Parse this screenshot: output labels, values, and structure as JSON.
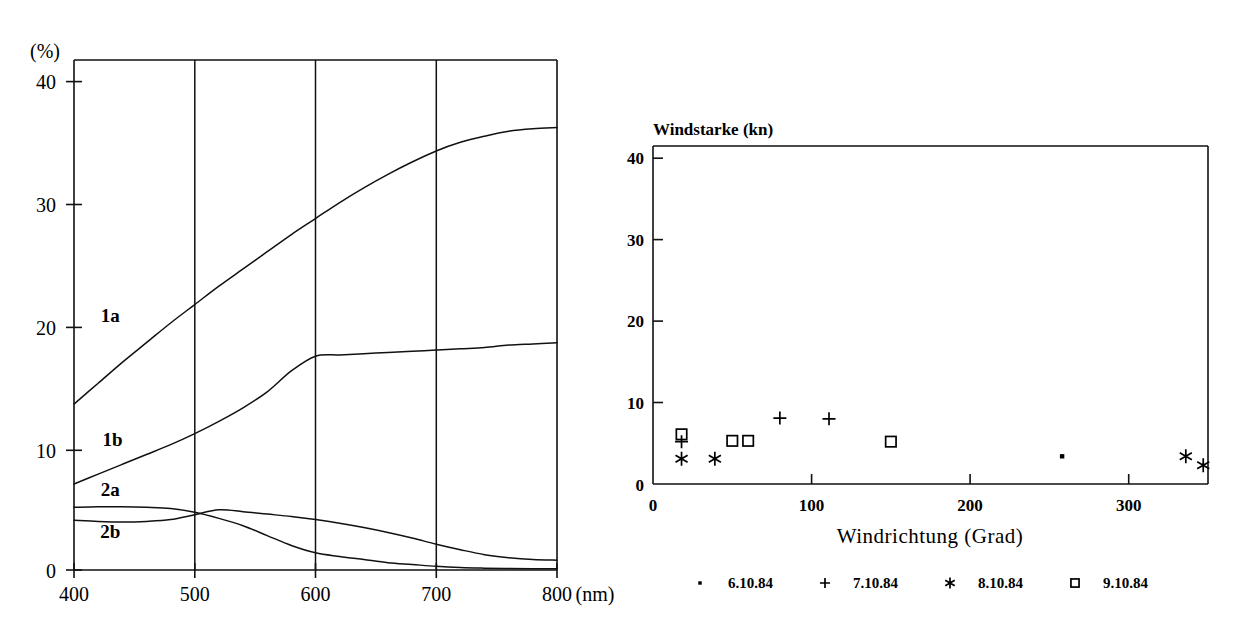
{
  "chart_data": [
    {
      "id": "spectral-transmission-chart",
      "type": "line",
      "title": "",
      "xlabel": "(nm)",
      "ylabel": "(%)",
      "xlim": [
        400,
        800
      ],
      "ylim": [
        0,
        41.5
      ],
      "xticks": [
        400,
        500,
        600,
        700,
        800
      ],
      "yticks": [
        0,
        10,
        20,
        30,
        40
      ],
      "xtick_labels": [
        "400",
        "500",
        "600",
        "700",
        "800"
      ],
      "ytick_labels": [
        "0",
        "10",
        "20",
        "30",
        "40"
      ],
      "grid": "vertical",
      "legend_position": "inline-curve-labels",
      "x": [
        400,
        420,
        440,
        460,
        480,
        500,
        520,
        540,
        560,
        580,
        600,
        620,
        640,
        660,
        680,
        700,
        720,
        740,
        760,
        780,
        800
      ],
      "series": [
        {
          "name": "1a",
          "label": "1a",
          "label_x": 430,
          "label_y": 20.2,
          "values": [
            13.5,
            15.2,
            16.9,
            18.5,
            20.1,
            21.6,
            23.1,
            24.5,
            25.9,
            27.3,
            28.6,
            29.9,
            31.1,
            32.2,
            33.2,
            34.1,
            34.8,
            35.3,
            35.7,
            35.9,
            36.0
          ]
        },
        {
          "name": "1b",
          "label": "1b",
          "label_x": 432,
          "label_y": 10.1,
          "values": [
            7.0,
            7.8,
            8.6,
            9.4,
            10.2,
            11.1,
            12.1,
            13.2,
            14.5,
            16.2,
            17.4,
            17.5,
            17.6,
            17.7,
            17.8,
            17.9,
            18.0,
            18.1,
            18.3,
            18.4,
            18.5
          ]
        },
        {
          "name": "2a",
          "label": "2a",
          "label_x": 430,
          "label_y": 6.0,
          "values": [
            5.1,
            5.15,
            5.15,
            5.1,
            5.0,
            4.7,
            4.2,
            3.6,
            2.8,
            2.0,
            1.4,
            1.1,
            0.85,
            0.6,
            0.45,
            0.3,
            0.2,
            0.15,
            0.12,
            0.1,
            0.1
          ]
        },
        {
          "name": "2b",
          "label": "2b",
          "label_x": 430,
          "label_y": 2.6,
          "values": [
            4.05,
            3.95,
            3.9,
            3.95,
            4.1,
            4.5,
            4.9,
            4.75,
            4.55,
            4.35,
            4.1,
            3.8,
            3.45,
            3.05,
            2.6,
            2.1,
            1.65,
            1.25,
            1.0,
            0.85,
            0.8
          ]
        }
      ]
    },
    {
      "id": "wind-scatter-chart",
      "type": "scatter",
      "title": "Windstarke (kn)",
      "xlabel": "Windrichtung (Grad)",
      "ylabel": "",
      "xlim": [
        0,
        350
      ],
      "ylim": [
        0,
        41.5
      ],
      "xticks": [
        0,
        100,
        200,
        300
      ],
      "yticks": [
        0,
        10,
        20,
        30,
        40
      ],
      "xtick_labels": [
        "0",
        "100",
        "200",
        "300"
      ],
      "ytick_labels": [
        "0",
        "10",
        "20",
        "30",
        "40"
      ],
      "grid": "off",
      "legend_position": "bottom",
      "series": [
        {
          "name": "6.10.84",
          "label": "6.10.84",
          "marker": "dot",
          "points": [
            [
              258,
              3.4
            ]
          ]
        },
        {
          "name": "7.10.84",
          "label": "7.10.84",
          "marker": "plus",
          "points": [
            [
              18,
              5.2
            ],
            [
              80,
              8.1
            ],
            [
              111,
              8.0
            ]
          ]
        },
        {
          "name": "8.10.84",
          "label": "8.10.84",
          "marker": "asterisk",
          "points": [
            [
              18,
              3.1
            ],
            [
              39,
              3.1
            ],
            [
              336,
              3.4
            ],
            [
              347,
              2.3
            ]
          ]
        },
        {
          "name": "9.10.84",
          "label": "9.10.84",
          "marker": "square",
          "points": [
            [
              18,
              6.1
            ],
            [
              50,
              5.3
            ],
            [
              60,
              5.3
            ],
            [
              150,
              5.2
            ]
          ]
        }
      ]
    }
  ],
  "left_chart": {
    "y_unit": "(%)",
    "x_unit": "(nm)",
    "ytick_labels": [
      "40",
      "30",
      "20",
      "10",
      "0"
    ],
    "xtick_labels": [
      "400",
      "500",
      "600",
      "700",
      "800"
    ],
    "curve_labels": [
      "1a",
      "1b",
      "2a",
      "2b"
    ]
  },
  "right_chart": {
    "title": "Windstarke (kn)",
    "xlabel": "Windrichtung (Grad)",
    "ytick_labels": [
      "40",
      "30",
      "20",
      "10",
      "0"
    ],
    "xtick_labels": [
      "0",
      "100",
      "200",
      "300"
    ],
    "legend": [
      {
        "marker": "dot",
        "label": "6.10.84"
      },
      {
        "marker": "plus",
        "label": "7.10.84"
      },
      {
        "marker": "asterisk",
        "label": "8.10.84"
      },
      {
        "marker": "square",
        "label": "9.10.84"
      }
    ]
  },
  "colors": {
    "ink": "#111111",
    "background": "#ffffff"
  }
}
